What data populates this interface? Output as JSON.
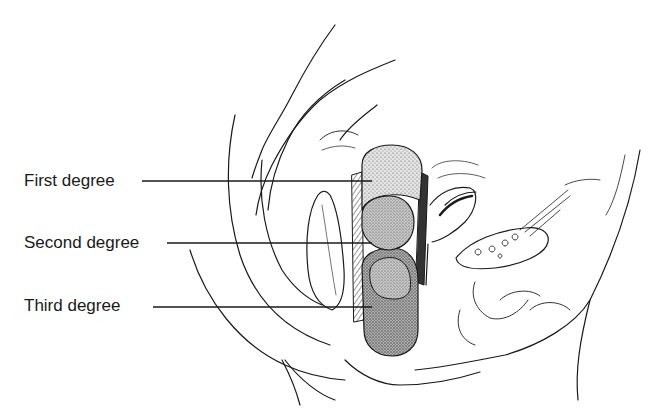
{
  "diagram": {
    "labels": [
      {
        "text": "First degree",
        "x": 24,
        "y": 173,
        "leader_end_x": 372,
        "leader_y": 181
      },
      {
        "text": "Second degree",
        "x": 24,
        "y": 235,
        "leader_end_x": 372,
        "leader_y": 243
      },
      {
        "text": "Third degree",
        "x": 24,
        "y": 297,
        "leader_end_x": 372,
        "leader_y": 307
      }
    ],
    "colors": {
      "line": "#1a1a1a",
      "stipple_light": "#d9d9d9",
      "stipple_mid": "#bdbdbd",
      "stipple_dark": "#a6a6a6",
      "background": "#ffffff"
    }
  }
}
